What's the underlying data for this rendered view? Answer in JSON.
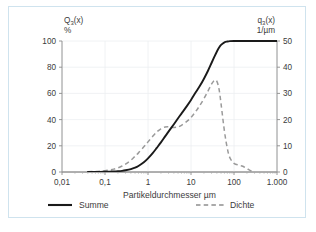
{
  "figure": {
    "border_color": "#cfe3ee",
    "background": "#ffffff"
  },
  "chart_data": {
    "type": "line",
    "title": "",
    "subtitle": "",
    "xlabel": "Partikeldurchmesser µm",
    "xscale": "log",
    "xlim": [
      0.01,
      1000
    ],
    "xticks": [
      0.01,
      0.1,
      1,
      10,
      100,
      1000
    ],
    "xticklabels": [
      "0,01",
      "0,1",
      "1",
      "10",
      "100",
      "1.000"
    ],
    "grid": true,
    "legend_position": "bottom",
    "axes": [
      {
        "side": "left",
        "name": "Q₃(x)",
        "name_base": "Q",
        "name_sub": "3",
        "name_tail": "(x)",
        "unit": "%",
        "ylim": [
          0,
          100
        ],
        "yticks": [
          0,
          20,
          40,
          60,
          80,
          100
        ],
        "yticklabels": [
          "0",
          "20",
          "40",
          "60",
          "80",
          "100"
        ]
      },
      {
        "side": "right",
        "name": "q₃(x)",
        "name_base": "q",
        "name_sub": "3",
        "name_tail": "(x)",
        "unit": "1/µm",
        "ylim": [
          0,
          50
        ],
        "yticks": [
          0,
          10,
          20,
          30,
          40,
          50
        ],
        "yticklabels": [
          "0",
          "10",
          "20",
          "30",
          "40",
          "50"
        ]
      }
    ],
    "series": [
      {
        "name": "Summe",
        "legend_label": "Summe",
        "axis": "left",
        "style": "solid",
        "color": "#1a1a1a",
        "width": 1.9,
        "ylabel": "Q₃(x) %",
        "x": [
          0.04,
          0.06,
          0.08,
          0.1,
          0.13,
          0.16,
          0.2,
          0.25,
          0.3,
          0.4,
          0.5,
          0.6,
          0.8,
          1.0,
          1.3,
          1.6,
          2.0,
          2.5,
          3.0,
          4.0,
          5.0,
          6.0,
          8.0,
          10.0,
          13.0,
          16.0,
          20.0,
          25.0,
          30.0,
          35.0,
          40.0,
          45.0,
          50.0,
          60.0,
          70.0,
          80.0,
          100.0,
          150.0,
          200.0,
          400.0,
          1000.0
        ],
        "y": [
          0.0,
          0.0,
          0.1,
          0.2,
          0.3,
          0.4,
          0.6,
          0.9,
          1.3,
          2.2,
          3.3,
          4.6,
          7.4,
          10.4,
          14.6,
          18.4,
          22.6,
          27.2,
          30.8,
          36.5,
          41.0,
          44.6,
          50.3,
          55.0,
          61.0,
          65.6,
          71.2,
          77.5,
          83.2,
          88.0,
          92.0,
          95.0,
          97.0,
          99.0,
          99.6,
          99.9,
          100.0,
          100.0,
          100.0,
          100.0,
          100.0
        ]
      },
      {
        "name": "Dichte",
        "legend_label": "Dichte",
        "axis": "right",
        "style": "dashed",
        "color": "#9a9a9a",
        "width": 1.5,
        "ylabel": "q₃(x) 1/µm",
        "x": [
          0.04,
          0.06,
          0.08,
          0.1,
          0.13,
          0.16,
          0.2,
          0.25,
          0.3,
          0.4,
          0.5,
          0.6,
          0.8,
          1.0,
          1.3,
          1.6,
          2.0,
          2.5,
          3.0,
          4.0,
          5.0,
          6.0,
          8.0,
          10.0,
          13.0,
          16.0,
          20.0,
          25.0,
          30.0,
          35.0,
          40.0,
          45.0,
          50.0,
          60.0,
          70.0,
          80.0,
          100.0,
          130.0,
          160.0,
          200.0,
          250.0,
          300.0
        ],
        "y_right_axis": [
          0.1,
          0.2,
          0.3,
          0.5,
          0.8,
          1.1,
          1.6,
          2.3,
          3.0,
          4.5,
          6.0,
          7.3,
          9.6,
          11.5,
          13.7,
          15.3,
          16.5,
          17.2,
          17.3,
          17.0,
          17.2,
          17.8,
          19.3,
          20.8,
          23.2,
          25.4,
          28.0,
          31.0,
          33.5,
          35.0,
          34.6,
          31.5,
          26.0,
          15.5,
          9.0,
          5.5,
          3.3,
          2.6,
          2.2,
          1.3,
          0.4,
          0.1
        ],
        "peak_x": 35,
        "peak_y": 35
      }
    ],
    "annotations": []
  },
  "legend": {
    "items": [
      {
        "label": "Summe",
        "style": "solid",
        "color": "#1a1a1a"
      },
      {
        "label": "Dichte",
        "style": "dashed",
        "color": "#8f8f8f"
      }
    ]
  }
}
